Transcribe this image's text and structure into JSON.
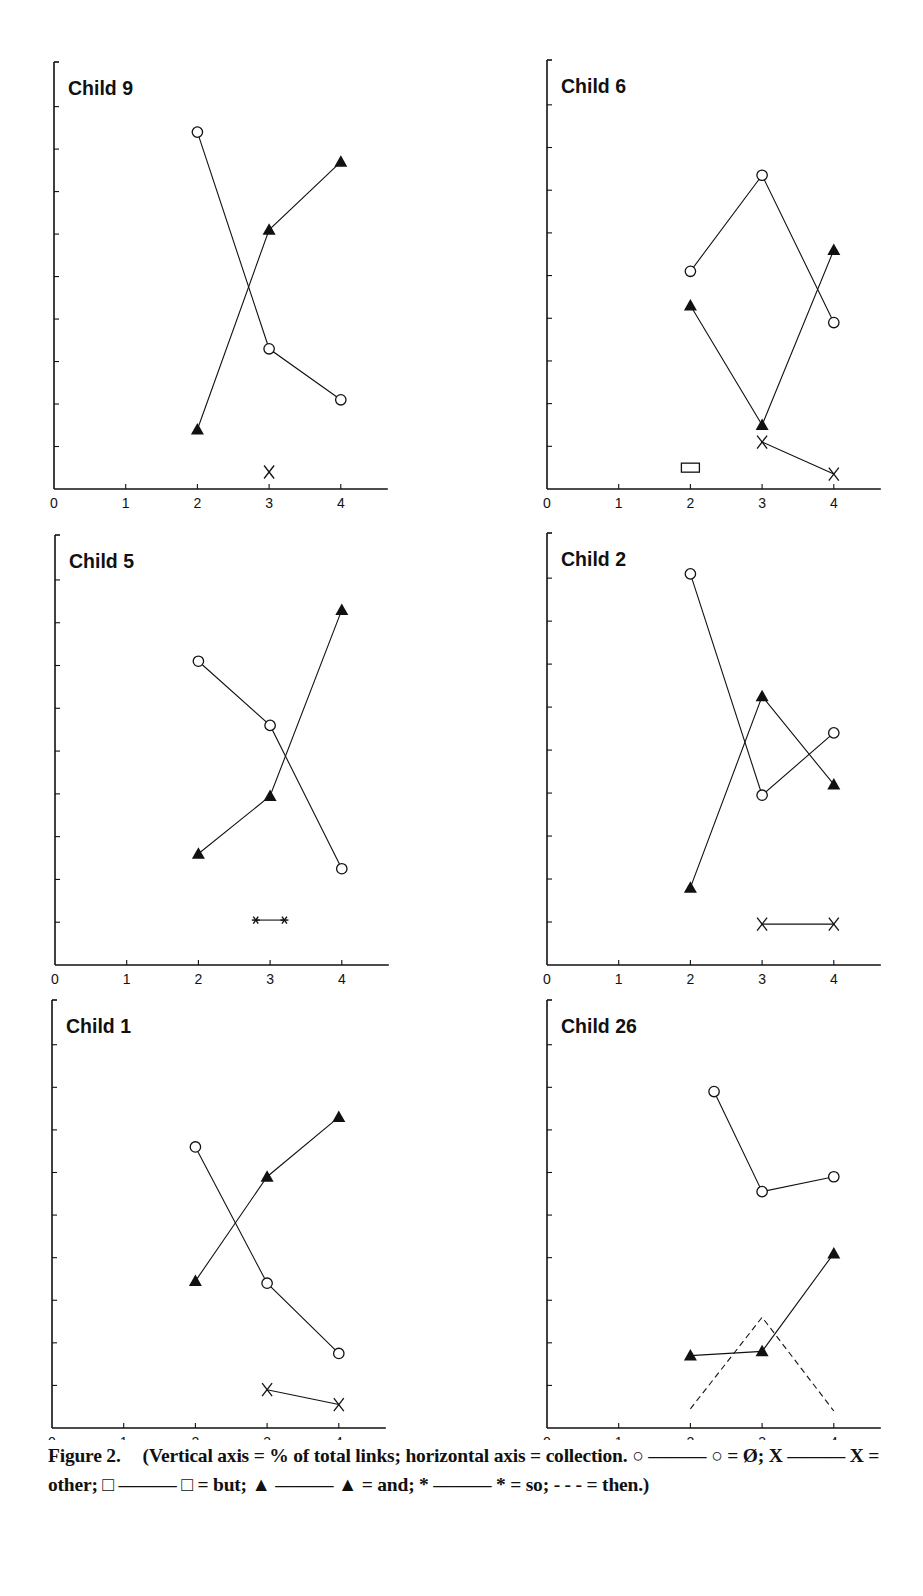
{
  "figure": {
    "label": "Figure 2.",
    "caption_text": "(Vertical axis = % of total links; horizontal axis = collection. ○ ——— ○ = Ø; X ——— X = other; □ ——— □ = but; ▲ ——— ▲ = and; * ——— * = so; - - - = then.)"
  },
  "legend": [
    {
      "symbol": "circle",
      "line": "solid",
      "label": "Ø"
    },
    {
      "symbol": "x",
      "line": "solid",
      "label": "other"
    },
    {
      "symbol": "square",
      "line": "solid",
      "label": "but"
    },
    {
      "symbol": "triangle",
      "line": "solid",
      "label": "and"
    },
    {
      "symbol": "star",
      "line": "solid",
      "label": "so"
    },
    {
      "symbol": "none",
      "line": "dashed",
      "label": "then"
    }
  ],
  "colors": {
    "ink": "#111111",
    "background": "#ffffff"
  },
  "chart_data": [
    {
      "type": "line",
      "title": "Child 9",
      "xlabel": "collection",
      "ylabel": "% of total links",
      "x_ticks": [
        "0",
        "1",
        "2",
        "3",
        "4"
      ],
      "xlim": [
        0,
        4.6
      ],
      "ylim": [
        0,
        10
      ],
      "y_ticks_unlabeled": 10,
      "grid": false,
      "position": "row1-left",
      "series": [
        {
          "name": "Ø",
          "marker": "circle",
          "line": "solid",
          "points": [
            [
              2,
              8.4
            ],
            [
              3,
              3.3
            ],
            [
              4,
              2.1
            ]
          ]
        },
        {
          "name": "and",
          "marker": "triangle",
          "line": "solid",
          "points": [
            [
              2,
              1.4
            ],
            [
              3,
              6.1
            ],
            [
              4,
              7.7
            ]
          ]
        },
        {
          "name": "other",
          "marker": "x",
          "line": "solid",
          "points": [
            [
              3,
              0.4
            ]
          ]
        }
      ]
    },
    {
      "type": "line",
      "title": "Child 6",
      "xlabel": "collection",
      "ylabel": "% of total links",
      "x_ticks": [
        "0",
        "1",
        "2",
        "3",
        "4"
      ],
      "xlim": [
        0,
        4.6
      ],
      "ylim": [
        0,
        10
      ],
      "y_ticks_unlabeled": 10,
      "grid": false,
      "position": "row1-right",
      "series": [
        {
          "name": "Ø",
          "marker": "circle",
          "line": "solid",
          "points": [
            [
              2,
              5.1
            ],
            [
              3,
              7.35
            ],
            [
              4,
              3.9
            ]
          ]
        },
        {
          "name": "and",
          "marker": "triangle",
          "line": "solid",
          "points": [
            [
              2,
              4.3
            ],
            [
              3,
              1.5
            ],
            [
              4,
              5.6
            ]
          ]
        },
        {
          "name": "other",
          "marker": "x",
          "line": "solid",
          "points": [
            [
              3,
              1.1
            ],
            [
              4,
              0.35
            ]
          ]
        },
        {
          "name": "but",
          "marker": "square",
          "line": "solid",
          "points": [
            [
              2,
              0.5
            ]
          ]
        }
      ]
    },
    {
      "type": "line",
      "title": "Child 5",
      "xlabel": "collection",
      "ylabel": "% of total links",
      "x_ticks": [
        "0",
        "1",
        "2",
        "3",
        "4"
      ],
      "xlim": [
        0,
        4.6
      ],
      "ylim": [
        0,
        10
      ],
      "y_ticks_unlabeled": 10,
      "grid": false,
      "position": "row2-left",
      "series": [
        {
          "name": "Ø",
          "marker": "circle",
          "line": "solid",
          "points": [
            [
              2,
              7.1
            ],
            [
              3,
              5.6
            ],
            [
              4,
              2.25
            ]
          ]
        },
        {
          "name": "and",
          "marker": "triangle",
          "line": "solid",
          "points": [
            [
              2,
              2.6
            ],
            [
              3,
              3.95
            ],
            [
              4,
              8.3
            ]
          ]
        },
        {
          "name": "so",
          "marker": "star",
          "line": "solid",
          "points": [
            [
              2.8,
              1.05
            ],
            [
              3.2,
              1.05
            ]
          ]
        }
      ]
    },
    {
      "type": "line",
      "title": "Child 2",
      "xlabel": "collection",
      "ylabel": "% of total links",
      "x_ticks": [
        "0",
        "1",
        "2",
        "3",
        "4"
      ],
      "xlim": [
        0,
        4.6
      ],
      "ylim": [
        0,
        10
      ],
      "y_ticks_unlabeled": 10,
      "grid": false,
      "position": "row2-right",
      "series": [
        {
          "name": "Ø",
          "marker": "circle",
          "line": "solid",
          "points": [
            [
              2,
              9.1
            ],
            [
              3,
              3.95
            ],
            [
              4,
              5.4
            ]
          ]
        },
        {
          "name": "and",
          "marker": "triangle",
          "line": "solid",
          "points": [
            [
              2,
              1.8
            ],
            [
              3,
              6.25
            ],
            [
              4,
              4.2
            ]
          ]
        },
        {
          "name": "other",
          "marker": "x",
          "line": "solid",
          "points": [
            [
              3,
              0.95
            ],
            [
              4,
              0.95
            ]
          ]
        }
      ]
    },
    {
      "type": "line",
      "title": "Child 1",
      "xlabel": "collection",
      "ylabel": "% of total links",
      "x_ticks": [
        "0",
        "1",
        "2",
        "3",
        "4"
      ],
      "xlim": [
        0,
        4.6
      ],
      "ylim": [
        0,
        10
      ],
      "y_ticks_unlabeled": 10,
      "grid": false,
      "position": "row3-left",
      "series": [
        {
          "name": "Ø",
          "marker": "circle",
          "line": "solid",
          "points": [
            [
              2,
              6.6
            ],
            [
              3,
              3.4
            ],
            [
              4,
              1.75
            ]
          ]
        },
        {
          "name": "and",
          "marker": "triangle",
          "line": "solid",
          "points": [
            [
              2,
              3.45
            ],
            [
              3,
              5.9
            ],
            [
              4,
              7.3
            ]
          ]
        },
        {
          "name": "other",
          "marker": "x",
          "line": "solid",
          "points": [
            [
              3,
              0.9
            ],
            [
              4,
              0.55
            ]
          ]
        }
      ]
    },
    {
      "type": "line",
      "title": "Child 26",
      "xlabel": "collection",
      "ylabel": "% of total links",
      "x_ticks": [
        "0",
        "1",
        "2",
        "3",
        "4"
      ],
      "xlim": [
        0,
        4.6
      ],
      "ylim": [
        0,
        10
      ],
      "y_ticks_unlabeled": 10,
      "grid": false,
      "position": "row3-right",
      "series": [
        {
          "name": "Ø",
          "marker": "circle",
          "line": "solid",
          "points": [
            [
              2.33,
              7.9
            ],
            [
              3,
              5.55
            ],
            [
              4,
              5.9
            ]
          ]
        },
        {
          "name": "and",
          "marker": "triangle",
          "line": "solid",
          "points": [
            [
              2,
              1.7
            ],
            [
              3,
              1.8
            ],
            [
              4,
              4.1
            ]
          ]
        },
        {
          "name": "then",
          "marker": "none",
          "line": "dashed",
          "points": [
            [
              2,
              0.45
            ],
            [
              3,
              2.6
            ],
            [
              4,
              0.4
            ]
          ]
        }
      ]
    }
  ]
}
